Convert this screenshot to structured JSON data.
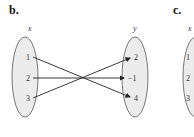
{
  "panels": [
    {
      "label": "b.",
      "domain_label": "x",
      "range_label": "y",
      "domain": [
        "1",
        "2",
        "3"
      ],
      "range": [
        "2",
        "−1",
        "4"
      ],
      "mappings": [
        {
          "from": "1",
          "to": "4"
        },
        {
          "from": "2",
          "to": "−1"
        },
        {
          "from": "3",
          "to": "2"
        }
      ]
    },
    {
      "label": "c.",
      "domain_label": "x",
      "domain": [
        "1",
        "2",
        "3"
      ]
    }
  ],
  "colors": {
    "oval_fill": "#ececec",
    "oval_stroke": "#555555",
    "arrow": "#222222"
  }
}
